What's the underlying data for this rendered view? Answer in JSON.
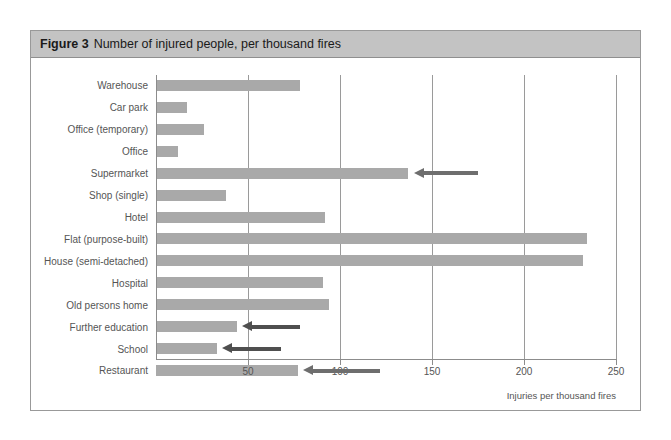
{
  "figure": {
    "number_label": "Figure 3",
    "title": "Number of injured people, per thousand fires"
  },
  "axis_caption": "Injuries per thousand fires",
  "colors": {
    "bar": "#a9a9a9",
    "header_background": "#c3c3c3",
    "gridline": "#9a9a9a",
    "arrow_light": "#6e6e6e",
    "arrow_dark": "#4f4f4f",
    "text": "#555555",
    "panel_border": "#999999"
  },
  "chart_data": {
    "type": "bar",
    "orientation": "horizontal",
    "title": "Number of injured people, per thousand fires",
    "xlabel": "Injuries per thousand fires",
    "ylabel": "",
    "xlim": [
      0,
      250
    ],
    "ticks": [
      50,
      100,
      150,
      200,
      250
    ],
    "grid": true,
    "legend": false,
    "categories": [
      "Warehouse",
      "Car park",
      "Office (temporary)",
      "Office",
      "Supermarket",
      "Shop (single)",
      "Hotel",
      "Flat (purpose-built)",
      "House (semi-detached)",
      "Hospital",
      "Old persons home",
      "Further education",
      "School",
      "Restaurant"
    ],
    "values": [
      78,
      17,
      26,
      12,
      137,
      38,
      92,
      234,
      232,
      91,
      94,
      44,
      33,
      77
    ],
    "annotations": [
      {
        "type": "arrow",
        "points_to": "Supermarket",
        "direction": "left",
        "tip_value": 140,
        "tail_value": 175,
        "style": "light"
      },
      {
        "type": "arrow",
        "points_to": "Further education",
        "direction": "left",
        "tip_value": 47,
        "tail_value": 78,
        "style": "dark"
      },
      {
        "type": "arrow",
        "points_to": "School",
        "direction": "left",
        "tip_value": 36,
        "tail_value": 68,
        "style": "dark"
      },
      {
        "type": "arrow",
        "points_to": "Restaurant",
        "direction": "left",
        "tip_value": 80,
        "tail_value": 122,
        "style": "light"
      }
    ]
  }
}
